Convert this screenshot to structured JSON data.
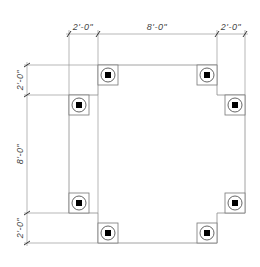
{
  "drawing": {
    "type": "plan",
    "description": "Column layout plan with dimensions",
    "colors": {
      "line": "#8a8a8a",
      "text": "#444444",
      "column_core": "#000000"
    }
  },
  "dimensions": {
    "top": [
      {
        "label": "2'-0\""
      },
      {
        "label": "8'-0\""
      },
      {
        "label": "2'-0\""
      }
    ],
    "left": [
      {
        "label": "2'-0\""
      },
      {
        "label": "8'-0\""
      },
      {
        "label": "2'-0\""
      }
    ]
  },
  "columns": [
    {
      "id": "col-1",
      "icon": "column-icon"
    },
    {
      "id": "col-2",
      "icon": "column-icon"
    },
    {
      "id": "col-3",
      "icon": "column-icon"
    },
    {
      "id": "col-4",
      "icon": "column-icon"
    },
    {
      "id": "col-5",
      "icon": "column-icon"
    },
    {
      "id": "col-6",
      "icon": "column-icon"
    },
    {
      "id": "col-7",
      "icon": "column-icon"
    },
    {
      "id": "col-8",
      "icon": "column-icon"
    }
  ]
}
